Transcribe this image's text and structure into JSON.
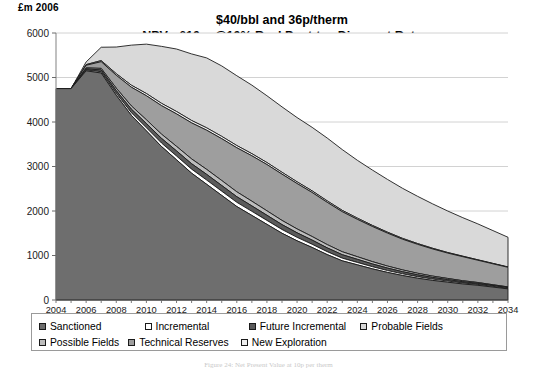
{
  "axis_title": "£m 2006",
  "title": {
    "line1": "$40/bbl and 36p/therm",
    "line2": "NPV : £10m @10% Real Post-tax Discount Rate"
  },
  "caption": "Figure 24: Net Present Value at 10p per therm",
  "legend": {
    "row1": [
      {
        "label": "Sanctioned",
        "color": "#6e6e6e"
      },
      {
        "label": "Incremental",
        "color": "#ffffff"
      },
      {
        "label": "Future Incremental",
        "color": "#5a5a5a"
      },
      {
        "label": "Probable Fields",
        "color": "#d9d9d9"
      }
    ],
    "row2": [
      {
        "label": "Possible Fields",
        "color": "#bdbdbd"
      },
      {
        "label": "Technical Reserves",
        "color": "#9e9e9e"
      },
      {
        "label": "New Exploration",
        "color": "#efefef"
      }
    ]
  },
  "chart_data": {
    "type": "area",
    "stacked": true,
    "xlabel": "",
    "ylabel": "£m 2006",
    "ylim": [
      0,
      6000
    ],
    "ytick_step": 1000,
    "yticks": [
      0,
      1000,
      2000,
      3000,
      4000,
      5000,
      6000
    ],
    "xlim": [
      2004,
      2034
    ],
    "xtick_step": 2,
    "grid": true,
    "legend_position": "bottom",
    "x": [
      2004,
      2005,
      2006,
      2007,
      2008,
      2009,
      2010,
      2011,
      2012,
      2013,
      2014,
      2015,
      2016,
      2017,
      2018,
      2019,
      2020,
      2021,
      2022,
      2023,
      2024,
      2025,
      2026,
      2027,
      2028,
      2029,
      2030,
      2031,
      2032,
      2033,
      2034
    ],
    "series": [
      {
        "name": "Sanctioned",
        "color": "#6e6e6e",
        "values": [
          4750,
          4750,
          5150,
          5100,
          4600,
          4150,
          3800,
          3450,
          3150,
          2850,
          2600,
          2350,
          2100,
          1900,
          1700,
          1500,
          1330,
          1180,
          1020,
          880,
          790,
          700,
          620,
          550,
          490,
          440,
          400,
          360,
          330,
          290,
          250
        ]
      },
      {
        "name": "Incremental",
        "color": "#ffffff",
        "values": [
          0,
          0,
          20,
          30,
          45,
          60,
          70,
          78,
          85,
          90,
          95,
          95,
          95,
          92,
          88,
          84,
          78,
          72,
          66,
          60,
          54,
          48,
          42,
          38,
          34,
          30,
          26,
          23,
          20,
          17,
          14
        ]
      },
      {
        "name": "Future Incremental",
        "color": "#5a5a5a",
        "values": [
          0,
          0,
          25,
          40,
          60,
          80,
          95,
          105,
          115,
          122,
          128,
          128,
          126,
          122,
          116,
          110,
          102,
          94,
          86,
          78,
          70,
          62,
          55,
          48,
          42,
          37,
          32,
          28,
          24,
          20,
          17
        ]
      },
      {
        "name": "Possible Fields",
        "color": "#bdbdbd",
        "values": [
          0,
          0,
          20,
          35,
          55,
          72,
          85,
          95,
          102,
          108,
          112,
          112,
          110,
          106,
          100,
          94,
          87,
          80,
          73,
          66,
          59,
          52,
          46,
          40,
          35,
          30,
          26,
          22,
          19,
          16,
          13
        ]
      },
      {
        "name": "Technical Reserves",
        "color": "#9e9e9e",
        "values": [
          0,
          0,
          60,
          150,
          290,
          420,
          540,
          640,
          730,
          810,
          880,
          940,
          990,
          1020,
          1040,
          1040,
          1020,
          990,
          950,
          900,
          840,
          790,
          740,
          690,
          650,
          610,
          570,
          540,
          500,
          470,
          440
        ]
      },
      {
        "name": "New Exploration",
        "color": "#efefef",
        "values": [
          0,
          0,
          15,
          25,
          35,
          45,
          50,
          52,
          54,
          54,
          54,
          52,
          50,
          48,
          45,
          42,
          39,
          36,
          33,
          30,
          27,
          24,
          21,
          19,
          17,
          15,
          13,
          11,
          10,
          9,
          8
        ]
      },
      {
        "name": "Probable Fields",
        "color": "#d9d9d9",
        "values": [
          0,
          0,
          60,
          300,
          600,
          900,
          1110,
          1280,
          1404,
          1496,
          1571,
          1583,
          1569,
          1540,
          1501,
          1470,
          1444,
          1428,
          1412,
          1366,
          1300,
          1244,
          1186,
          1125,
          1062,
          998,
          933,
          866,
          807,
          738,
          668
        ]
      }
    ]
  }
}
